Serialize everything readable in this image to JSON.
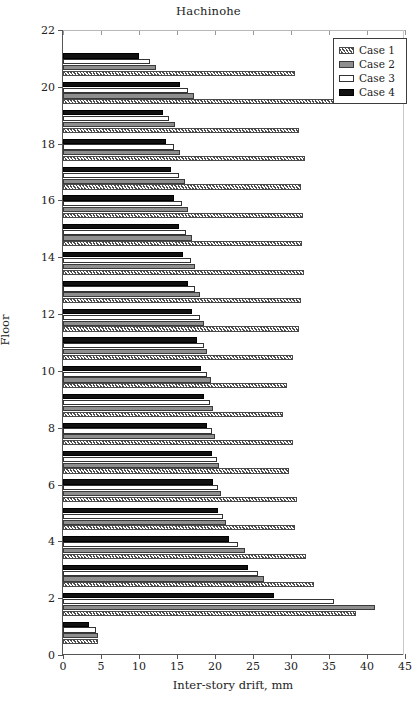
{
  "chart_data": {
    "type": "bar",
    "orientation": "horizontal",
    "title": "Hachinohe",
    "xlabel": "Inter-story drift, mm",
    "ylabel": "Floor",
    "xlim": [
      0,
      45
    ],
    "ylim": [
      0,
      22
    ],
    "xticks": [
      0,
      5,
      10,
      15,
      20,
      25,
      30,
      35,
      40,
      45
    ],
    "yticks": [
      0,
      2,
      4,
      6,
      8,
      10,
      12,
      14,
      16,
      18,
      20,
      22
    ],
    "grid": false,
    "legend_position": "top-right",
    "categories": [
      1,
      2,
      3,
      4,
      5,
      6,
      7,
      8,
      9,
      10,
      11,
      12,
      13,
      14,
      15,
      16,
      17,
      18,
      19,
      20,
      21
    ],
    "series": [
      {
        "name": "Case 1",
        "style": "hatched-light",
        "values": [
          4.6,
          38.5,
          33.0,
          32.0,
          30.5,
          30.8,
          29.8,
          30.2,
          29.0,
          29.5,
          30.2,
          31.0,
          31.3,
          31.7,
          31.5,
          31.6,
          31.3,
          31.8,
          31.0,
          40.0,
          30.5
        ]
      },
      {
        "name": "Case 2",
        "style": "solid-gray",
        "values": [
          4.6,
          41.0,
          26.5,
          24.0,
          21.4,
          20.8,
          20.5,
          20.0,
          19.8,
          19.5,
          19.0,
          18.6,
          18.0,
          17.4,
          17.0,
          16.4,
          16.0,
          15.4,
          14.8,
          17.2,
          12.2
        ]
      },
      {
        "name": "Case 3",
        "style": "white-outline",
        "values": [
          4.4,
          35.6,
          25.6,
          23.0,
          21.0,
          20.4,
          20.2,
          19.6,
          19.4,
          19.0,
          18.5,
          18.0,
          17.4,
          16.8,
          16.2,
          15.6,
          15.2,
          14.6,
          14.0,
          16.4,
          11.5
        ]
      },
      {
        "name": "Case 4",
        "style": "solid-black",
        "values": [
          3.4,
          27.7,
          24.4,
          21.8,
          20.4,
          19.8,
          19.6,
          19.0,
          18.6,
          18.2,
          17.6,
          17.0,
          16.4,
          15.8,
          15.2,
          14.6,
          14.2,
          13.6,
          13.2,
          15.4,
          10.0
        ]
      }
    ]
  },
  "legend": {
    "items": [
      {
        "label": "Case 1",
        "swatch": "hatched-light"
      },
      {
        "label": "Case 2",
        "swatch": "solid-gray"
      },
      {
        "label": "Case 3",
        "swatch": "white-outline"
      },
      {
        "label": "Case 4",
        "swatch": "solid-black"
      }
    ]
  }
}
